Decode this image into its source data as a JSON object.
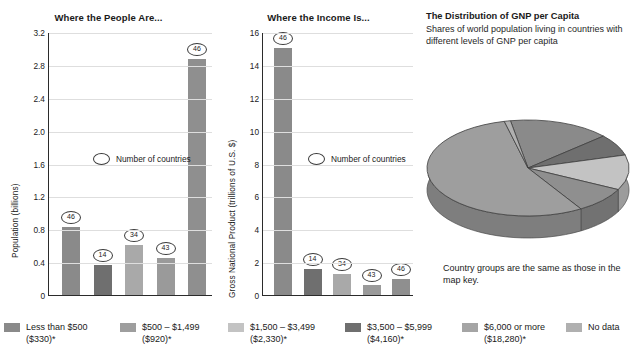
{
  "charts": {
    "people": {
      "title": "Where the People Are...",
      "ylabel": "Population (billions)",
      "ticks": [
        "3.2",
        "2.8",
        "2.4",
        "2.0",
        "1.6",
        "1.2",
        "0.8",
        "0.4",
        "0"
      ],
      "count_legend": "Number of countries"
    },
    "income": {
      "title": "Where the Income Is...",
      "ylabel": "Gross National Product (trillions of U.S. $)",
      "ticks": [
        "16",
        "14",
        "12",
        "10",
        "8",
        "6",
        "4",
        "2",
        "0"
      ],
      "count_legend": "Number of countries"
    }
  },
  "gnp": {
    "heading": "The Distribution of GNP per Capita",
    "subheading": "Shares of world population living in countries\nwith different levels of GNP per capita",
    "note": "Country groups are the same as those in the map key."
  },
  "legend": {
    "items": [
      {
        "label": "Less than $500\n($330)*",
        "color": "#8a8a8a"
      },
      {
        "label": "$500 – $1,499\n($920)*",
        "color": "#9e9e9e"
      },
      {
        "label": "$1,500 – $3,499\n($2,330)*",
        "color": "#c3c3c3"
      },
      {
        "label": "$3,500 – $5,999\n($4,160)*",
        "color": "#6f6f6f"
      },
      {
        "label": "$6,000 or more\n($18,280)*",
        "color": "#a5a5a5"
      },
      {
        "label": "No data",
        "color": "#b0b0b0"
      }
    ]
  },
  "chart_data": [
    {
      "type": "bar",
      "title": "Where the People Are...",
      "xlabel": "",
      "ylabel": "Population (billions)",
      "ylim": [
        0,
        3.2
      ],
      "ytick_values": [
        0,
        0.4,
        0.8,
        1.2,
        1.6,
        2.0,
        2.4,
        2.8,
        3.2
      ],
      "grid": true,
      "legend_position": "inside-center",
      "categories": [
        "Less than $500 ($330)*",
        "$500 – $1,499 ($920)*",
        "$1,500 – $3,499 ($2,330)*",
        "$3,500 – $5,999 ($4,160)*",
        "$6,000 or more ($18,280)*"
      ],
      "values": [
        0.83,
        0.37,
        0.61,
        0.45,
        2.87
      ],
      "colors": [
        "#8a8a8a",
        "#6f6f6f",
        "#a9a9a9",
        "#9a9a9a",
        "#8f8f8f"
      ],
      "annotations": [
        "46",
        "14",
        "34",
        "43",
        "46"
      ],
      "annotation_label": "Number of countries"
    },
    {
      "type": "bar",
      "title": "Where the Income Is...",
      "xlabel": "",
      "ylabel": "Gross National Product (trillions of U.S. $)",
      "ylim": [
        0,
        16
      ],
      "ytick_values": [
        0,
        2,
        4,
        6,
        8,
        10,
        12,
        14,
        16
      ],
      "grid": true,
      "legend_position": "inside-center",
      "categories": [
        "Less than $500 ($330)*",
        "$500 – $1,499 ($920)*",
        "$1,500 – $3,499 ($2,330)*",
        "$3,500 – $5,999 ($4,160)*",
        "$6,000 or more ($18,280)*"
      ],
      "values": [
        15.0,
        1.6,
        1.3,
        0.6,
        1.0
      ],
      "colors": [
        "#8a8a8a",
        "#6f6f6f",
        "#a9a9a9",
        "#9a9a9a",
        "#8f8f8f"
      ],
      "annotations": [
        "46",
        "14",
        "34",
        "43",
        "46"
      ],
      "annotation_label": "Number of countries"
    },
    {
      "type": "pie",
      "title": "The Distribution of GNP per Capita",
      "subtitle": "Shares of world population living in countries with different levels of GNP per capita",
      "labels": [
        "Less than $500 ($330)*",
        "$500 – $1,499 ($920)*",
        "$1,500 – $3,499 ($2,330)*",
        "$3,500 – $5,999 ($4,160)*",
        "$6,000 or more ($18,280)*",
        "No data"
      ],
      "values": [
        16.2,
        7.2,
        11.8,
        8.8,
        55.0,
        1.0
      ],
      "colors": [
        "#8a8a8a",
        "#6f6f6f",
        "#c3c3c3",
        "#8f8f8f",
        "#9e9e9e",
        "#b0b0b0"
      ],
      "style": "3d",
      "note": "Country groups are the same as those in the map key."
    }
  ]
}
